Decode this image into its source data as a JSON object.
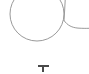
{
  "canvas": {
    "width": 89,
    "height": 74,
    "background_color": "#ffffff",
    "description": "blank white canvas fragment"
  },
  "shapes": {
    "stroke_color": "#9a9a9a",
    "stroke_width": 1,
    "fill": "none",
    "items": [
      {
        "name": "circle-outline",
        "type": "circle",
        "center_x": 37,
        "center_y": 14,
        "radius": 27,
        "clipped_top": true
      },
      {
        "name": "vertical-connector-stroke",
        "type": "line",
        "x1": 65,
        "y1": 0,
        "x2": 64,
        "y2": 21
      },
      {
        "name": "tail-curve",
        "type": "path",
        "start_x": 64,
        "start_y": 21,
        "end_x": 89,
        "end_y": 28
      }
    ]
  },
  "caret": {
    "name": "text-caret",
    "color": "#4a4a4a",
    "x": 38,
    "y": 65,
    "width": 11,
    "height": 7,
    "glyph": "I-beam"
  }
}
